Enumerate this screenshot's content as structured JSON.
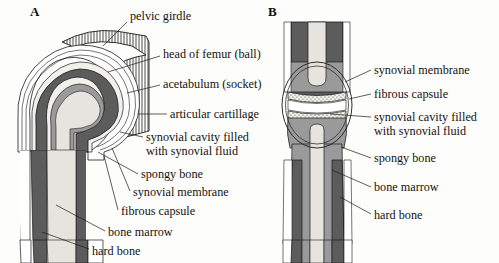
{
  "figure": {
    "background_color": "#fdfdfb",
    "width": 499,
    "height": 263
  },
  "panels": [
    {
      "letter": "A",
      "joint_type": "ball and socket joint (hip)",
      "x": 30,
      "y": 6
    },
    {
      "letter": "B",
      "joint_type": "hinge joint (knee)",
      "x": 268,
      "y": 6
    }
  ],
  "colors": {
    "hard_bone": "#5c5c5c",
    "spongy_bone": "#9a9a9a",
    "bone_marrow": "#e6e4de",
    "cartilage": "#f2f0ea",
    "synovial_fluid": "#ffffff",
    "outline": "#1a1a1a",
    "pelvic_hatch": "#3a3a3a",
    "text": "#15120f"
  },
  "labels_panel_a": [
    {
      "id": "pelvic-girdle",
      "text": "pelvic girdle",
      "x": 130,
      "y": 10,
      "leader": [
        [
          127,
          22
        ],
        [
          103,
          46
        ]
      ]
    },
    {
      "id": "head-of-femur",
      "text": "head of femur (ball)",
      "x": 163,
      "y": 48,
      "leader": [
        [
          160,
          56
        ],
        [
          108,
          72
        ]
      ]
    },
    {
      "id": "acetabulum",
      "text": "acetabulum (socket)",
      "x": 163,
      "y": 78,
      "leader": [
        [
          160,
          85
        ],
        [
          127,
          93
        ]
      ]
    },
    {
      "id": "articular-cartilage",
      "text": "articular cartillage",
      "x": 170,
      "y": 108,
      "leader": [
        [
          167,
          114
        ],
        [
          138,
          114
        ]
      ]
    },
    {
      "id": "synovial-cavity",
      "text": "synovial cavity filled\nwith synovial fluid",
      "x": 146,
      "y": 131,
      "leader": [
        [
          143,
          137
        ],
        [
          120,
          132
        ]
      ]
    },
    {
      "id": "spongy-bone",
      "text": "spongy bone",
      "x": 141,
      "y": 168,
      "leader": [
        [
          138,
          174
        ],
        [
          98,
          152
        ]
      ]
    },
    {
      "id": "synovial-membrane",
      "text": "synovial membrane",
      "x": 133,
      "y": 186,
      "leader": [
        [
          130,
          191
        ],
        [
          112,
          148
        ]
      ]
    },
    {
      "id": "fibrous-capsule",
      "text": "fibrous capsule",
      "x": 121,
      "y": 205,
      "leader": [
        [
          118,
          210
        ],
        [
          104,
          156
        ]
      ]
    },
    {
      "id": "bone-marrow",
      "text": "bone marrow",
      "x": 108,
      "y": 226,
      "leader": [
        [
          105,
          231
        ],
        [
          56,
          205
        ]
      ]
    },
    {
      "id": "hard-bone",
      "text": "hard bone",
      "x": 92,
      "y": 245,
      "leader": [
        [
          89,
          249
        ],
        [
          42,
          232
        ]
      ]
    }
  ],
  "labels_panel_b": [
    {
      "id": "synovial-membrane-b",
      "text": "synovial membrane",
      "x": 374,
      "y": 64,
      "leader": [
        [
          371,
          70
        ],
        [
          345,
          82
        ]
      ]
    },
    {
      "id": "fibrous-capsule-b",
      "text": "fibrous capsule",
      "x": 374,
      "y": 88,
      "leader": [
        [
          371,
          94
        ],
        [
          349,
          99
        ]
      ]
    },
    {
      "id": "synovial-cavity-b",
      "text": "synovial cavity filled\nwith synovial fluid",
      "x": 374,
      "y": 111,
      "leader": [
        [
          371,
          117
        ],
        [
          330,
          114
        ]
      ]
    },
    {
      "id": "spongy-bone-b",
      "text": "spongy bone",
      "x": 374,
      "y": 152,
      "leader": [
        [
          371,
          158
        ],
        [
          341,
          147
        ]
      ]
    },
    {
      "id": "bone-marrow-b",
      "text": "bone marrow",
      "x": 374,
      "y": 181,
      "leader": [
        [
          371,
          187
        ],
        [
          332,
          170
        ]
      ]
    },
    {
      "id": "hard-bone-b",
      "text": "hard bone",
      "x": 374,
      "y": 209,
      "leader": [
        [
          371,
          214
        ],
        [
          340,
          197
        ]
      ]
    }
  ]
}
